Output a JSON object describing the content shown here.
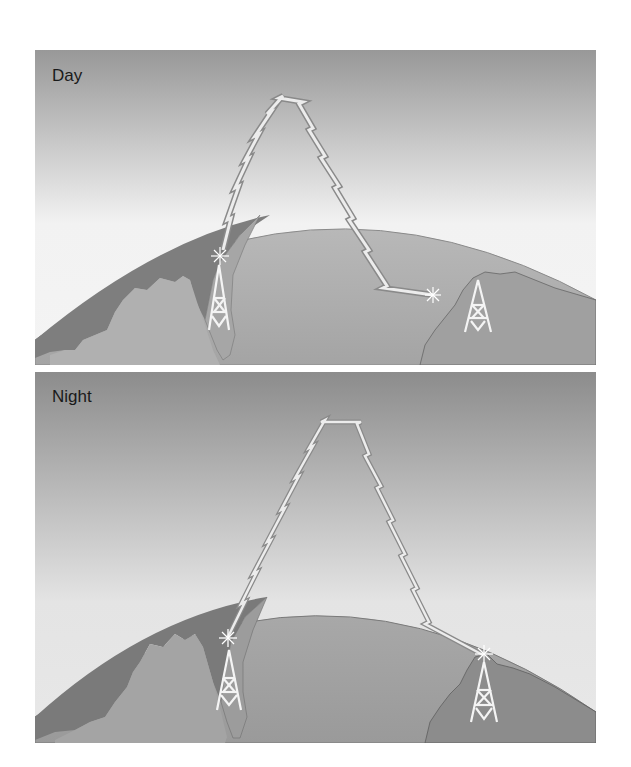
{
  "figure": {
    "panels": [
      {
        "label": "Day",
        "sky_top": "#989898",
        "sky_bottom": "#f2f2f2",
        "description": "Radio signal from tower reflects off ionosphere and lands short of the receiving tower"
      },
      {
        "label": "Night",
        "sky_top": "#8c8c8c",
        "sky_bottom": "#e4e4e4",
        "description": "Radio signal reflects off higher ionosphere layer and reaches the distant receiving tower"
      }
    ],
    "colors": {
      "ocean": "#a8a8a8",
      "land_dark": "#7e7e7e",
      "land_light": "#b2b2b2",
      "signal": "#e8e8e8",
      "signal_edge": "#8a8a8a",
      "tower": "#f4f4f4"
    }
  }
}
